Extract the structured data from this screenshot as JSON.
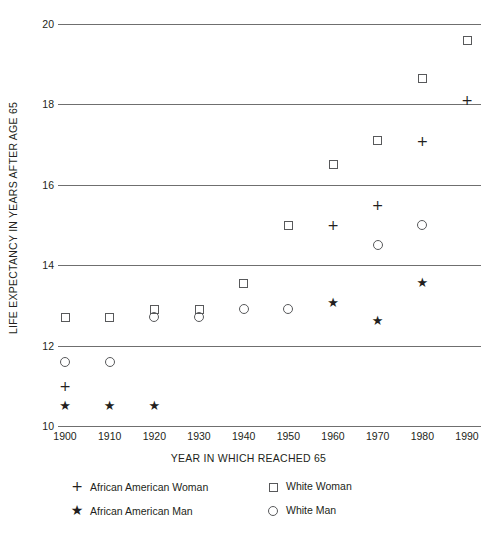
{
  "chart_data": {
    "type": "scatter",
    "title": "",
    "xlabel": "YEAR IN WHICH REACHED 65",
    "ylabel": "LIFE EXPECTANCY IN YEARS AFTER AGE 65",
    "grid": true,
    "legend_position": "bottom",
    "x": [
      1900,
      1910,
      1920,
      1930,
      1940,
      1950,
      1960,
      1970,
      1980,
      1990
    ],
    "xtick_labels": [
      "1900",
      "1910",
      "1920",
      "1930",
      "1940",
      "1950",
      "1960",
      "1970",
      "1980",
      "1990"
    ],
    "xlim": [
      1895,
      1995
    ],
    "ylim": [
      10,
      20
    ],
    "ytick_labels": [
      "20",
      "18",
      "16",
      "14",
      "12",
      "10"
    ],
    "ytick_values": [
      20,
      18,
      16,
      14,
      12,
      10
    ],
    "series": [
      {
        "name": "African American Woman",
        "marker": "plus",
        "points": [
          {
            "x": 1900,
            "y": 11.0
          },
          {
            "x": 1960,
            "y": 15.0
          },
          {
            "x": 1970,
            "y": 15.5
          },
          {
            "x": 1980,
            "y": 17.1
          },
          {
            "x": 1990,
            "y": 18.1
          }
        ]
      },
      {
        "name": "African American Man",
        "marker": "star",
        "points": [
          {
            "x": 1900,
            "y": 10.5
          },
          {
            "x": 1910,
            "y": 10.5
          },
          {
            "x": 1920,
            "y": 10.5
          },
          {
            "x": 1960,
            "y": 13.05
          },
          {
            "x": 1970,
            "y": 12.6
          },
          {
            "x": 1980,
            "y": 13.55
          }
        ]
      },
      {
        "name": "White Woman",
        "marker": "square",
        "points": [
          {
            "x": 1900,
            "y": 12.7
          },
          {
            "x": 1910,
            "y": 12.7
          },
          {
            "x": 1920,
            "y": 12.9
          },
          {
            "x": 1930,
            "y": 12.9
          },
          {
            "x": 1940,
            "y": 13.55
          },
          {
            "x": 1950,
            "y": 15.0
          },
          {
            "x": 1960,
            "y": 16.5
          },
          {
            "x": 1970,
            "y": 17.1
          },
          {
            "x": 1980,
            "y": 18.65
          },
          {
            "x": 1990,
            "y": 19.6
          }
        ]
      },
      {
        "name": "White Man",
        "marker": "circle",
        "points": [
          {
            "x": 1900,
            "y": 11.6
          },
          {
            "x": 1910,
            "y": 11.6
          },
          {
            "x": 1920,
            "y": 12.7
          },
          {
            "x": 1930,
            "y": 12.7
          },
          {
            "x": 1940,
            "y": 12.9
          },
          {
            "x": 1950,
            "y": 12.9
          },
          {
            "x": 1970,
            "y": 14.5
          },
          {
            "x": 1980,
            "y": 15.0
          }
        ]
      }
    ]
  },
  "legend": {
    "items": [
      {
        "label": "African American Woman",
        "marker": "plus",
        "glyph": "+"
      },
      {
        "label": "White Woman",
        "marker": "square",
        "glyph": ""
      },
      {
        "label": "African American Man",
        "marker": "star",
        "glyph": "★"
      },
      {
        "label": "White Man",
        "marker": "circle",
        "glyph": ""
      }
    ]
  },
  "colors": {
    "axis": "#6f6f6f",
    "marker": "#58595b",
    "text": "#231f20"
  },
  "caption": ""
}
